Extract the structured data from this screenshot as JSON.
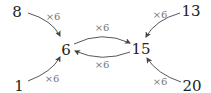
{
  "diagram": {
    "nodes": [
      {
        "id": "n8",
        "label": "8"
      },
      {
        "id": "n1",
        "label": "1"
      },
      {
        "id": "n6",
        "label": "6"
      },
      {
        "id": "n15",
        "label": "15"
      },
      {
        "id": "n13",
        "label": "13"
      },
      {
        "id": "n20",
        "label": "20"
      }
    ],
    "edges": [
      {
        "from": "8",
        "to": "6",
        "label": "×6"
      },
      {
        "from": "1",
        "to": "6",
        "label": "×6"
      },
      {
        "from": "6",
        "to": "15",
        "label": "×6"
      },
      {
        "from": "15",
        "to": "6",
        "label": "×6"
      },
      {
        "from": "13",
        "to": "15",
        "label": "×6"
      },
      {
        "from": "20",
        "to": "15",
        "label": "×6"
      }
    ],
    "colors": {
      "node_text": "#222222",
      "edge_label": "#777777",
      "edge": "#444444"
    }
  }
}
